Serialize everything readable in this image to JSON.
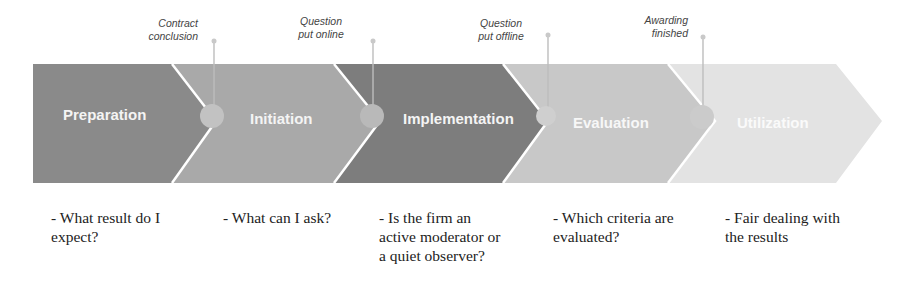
{
  "phases": [
    {
      "label": "Preparation",
      "color": "#8a8a8a",
      "text_color": "#f2f2f2"
    },
    {
      "label": "Initiation",
      "color": "#a9a9a9",
      "text_color": "#f2f2f2"
    },
    {
      "label": "Implementation",
      "color": "#7d7d7d",
      "text_color": "#f2f2f2"
    },
    {
      "label": "Evaluation",
      "color": "#c8c8c8",
      "text_color": "#f8f8f8"
    },
    {
      "label": "Utilization",
      "color": "#e3e3e3",
      "text_color": "#fbfbfb"
    }
  ],
  "milestones": [
    {
      "label": "Contract\nconclusion"
    },
    {
      "label": "Question\nput online"
    },
    {
      "label": "Question\nput offline"
    },
    {
      "label": "Awarding\nfinished"
    }
  ],
  "questions": [
    {
      "text": "- What result do I\nexpect?"
    },
    {
      "text": "- What can I ask?"
    },
    {
      "text": "- Is the firm an\nactive moderator or\na quiet observer?"
    },
    {
      "text": "- Which criteria are\nevaluated?"
    },
    {
      "text": "- Fair dealing with\nthe results"
    }
  ]
}
